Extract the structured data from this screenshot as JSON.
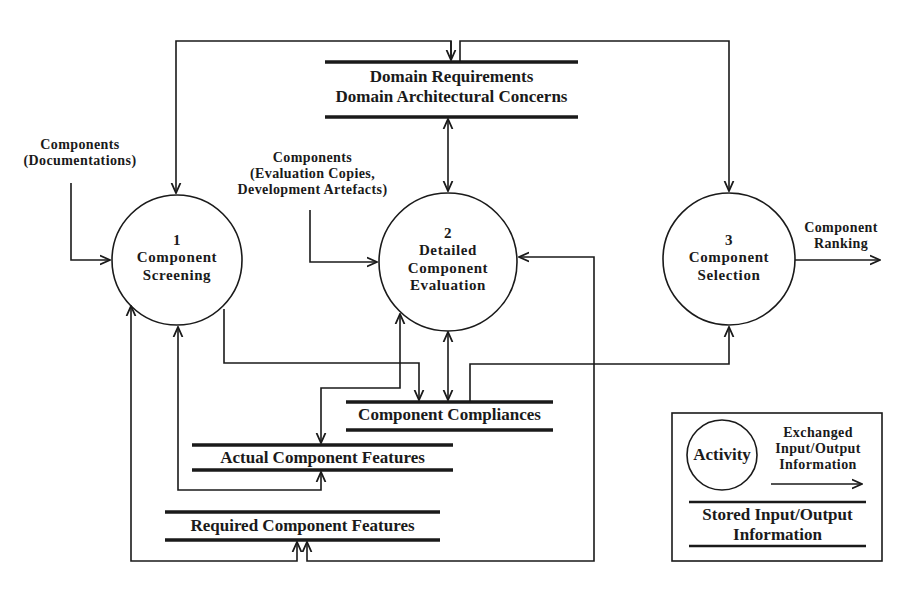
{
  "diagram": {
    "type": "data-flow-diagram",
    "processes": [
      {
        "id": "1",
        "number": "1",
        "line1": "Component",
        "line2": "Screening"
      },
      {
        "id": "2",
        "number": "2",
        "line1": "Detailed",
        "line2": "Component",
        "line3": "Evaluation"
      },
      {
        "id": "3",
        "number": "3",
        "line1": "Component",
        "line2": "Selection"
      }
    ],
    "stores": {
      "domain": {
        "line1": "Domain Requirements",
        "line2": "Domain Architectural Concerns"
      },
      "compliances": {
        "label": "Component Compliances"
      },
      "actual_features": {
        "label": "Actual Component Features"
      },
      "required_features": {
        "label": "Required Component Features"
      }
    },
    "external_flows": {
      "documentations": {
        "line1": "Components",
        "line2": "(Documentations)"
      },
      "evaluation": {
        "line1": "Components",
        "line2": "(Evaluation Copies,",
        "line3": "Development Artefacts)"
      },
      "ranking": {
        "line1": "Component",
        "line2": "Ranking"
      }
    },
    "legend": {
      "activity": "Activity",
      "exchanged_line1": "Exchanged",
      "exchanged_line2": "Input/Output",
      "exchanged_line3": "Information",
      "stored_line1": "Stored Input/Output",
      "stored_line2": "Information"
    },
    "colors": {
      "line": "#1a1a1a",
      "background": "#ffffff"
    }
  }
}
